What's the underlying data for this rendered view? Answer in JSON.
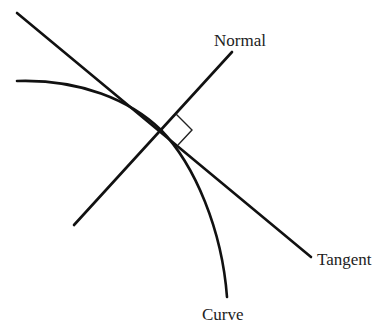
{
  "diagram": {
    "labels": {
      "normal": "Normal",
      "tangent": "Tangent",
      "curve": "Curve"
    },
    "colors": {
      "stroke": "#111111",
      "text": "#222222",
      "background": "#ffffff"
    },
    "elements": {
      "tangent_line": {
        "from": [
          17,
          13
        ],
        "to": [
          311,
          257
        ]
      },
      "normal_line": {
        "from": [
          74,
          225
        ],
        "to": [
          232,
          52
        ]
      },
      "curve": {
        "start": [
          17,
          81
        ],
        "through": [
          161,
          130
        ],
        "end": [
          227,
          297
        ]
      },
      "point_of_contact": [
        161,
        130
      ],
      "right_angle_marker": [
        [
          176,
          114
        ],
        [
          192,
          130
        ],
        [
          178,
          145
        ]
      ]
    }
  }
}
